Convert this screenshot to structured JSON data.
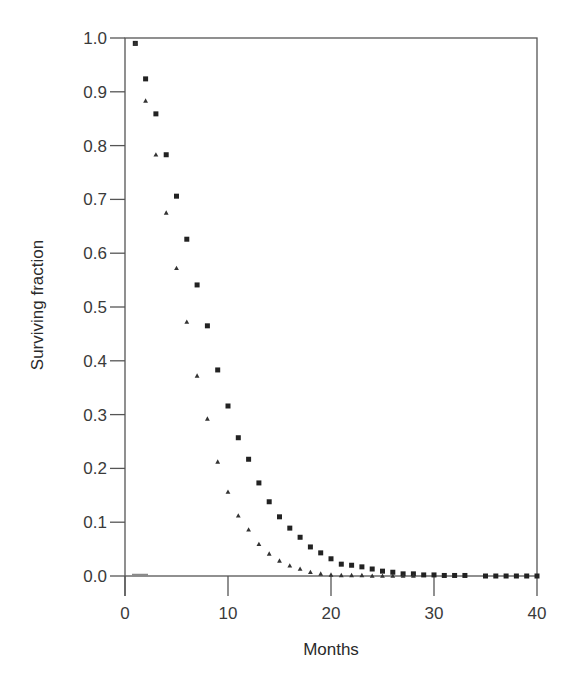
{
  "chart_data": {
    "type": "scatter",
    "title": "",
    "xlabel": "Months",
    "ylabel": "Surviving fraction",
    "xlim": [
      0,
      40
    ],
    "ylim": [
      0.0,
      1.0
    ],
    "x_ticks": [
      0,
      10,
      20,
      30,
      40
    ],
    "x_tick_labels": [
      "0",
      "10",
      "20",
      "30",
      "40"
    ],
    "y_ticks": [
      0.0,
      0.1,
      0.2,
      0.3,
      0.4,
      0.5,
      0.6,
      0.7,
      0.8,
      0.9,
      1.0
    ],
    "y_tick_labels": [
      "0.0",
      "0.1",
      "0.2",
      "0.3",
      "0.4",
      "0.5",
      "0.6",
      "0.7",
      "0.8",
      "0.9",
      "1.0"
    ],
    "grid": false,
    "legend": null,
    "series": [
      {
        "name": "squares",
        "marker": "square",
        "color": "#222222",
        "x": [
          1,
          2,
          3,
          4,
          5,
          6,
          7,
          8,
          9,
          10,
          11,
          12,
          13,
          14,
          15,
          16,
          17,
          18,
          19,
          20,
          21,
          22,
          23,
          24,
          25,
          26,
          27,
          28,
          29,
          30,
          31,
          32,
          33,
          35,
          36,
          37,
          38,
          39,
          40
        ],
        "values": [
          0.99,
          0.924,
          0.859,
          0.783,
          0.706,
          0.626,
          0.541,
          0.465,
          0.383,
          0.316,
          0.257,
          0.217,
          0.173,
          0.138,
          0.11,
          0.089,
          0.072,
          0.054,
          0.043,
          0.032,
          0.022,
          0.02,
          0.017,
          0.013,
          0.009,
          0.007,
          0.004,
          0.004,
          0.002,
          0.002,
          0.001,
          0.001,
          0.001,
          0.0,
          0.0,
          0.0,
          0.0,
          0.0,
          0.0
        ]
      },
      {
        "name": "triangles",
        "marker": "triangle",
        "color": "#333333",
        "x": [
          1,
          2,
          3,
          4,
          5,
          6,
          7,
          8,
          9,
          10,
          11,
          12,
          13,
          14,
          15,
          16,
          17,
          18,
          19,
          20,
          21,
          22,
          23,
          24,
          25,
          26,
          27,
          28
        ],
        "values": [
          0.99,
          0.883,
          0.783,
          0.675,
          0.572,
          0.472,
          0.372,
          0.292,
          0.212,
          0.156,
          0.112,
          0.086,
          0.059,
          0.041,
          0.028,
          0.019,
          0.013,
          0.007,
          0.004,
          0.002,
          0.001,
          0.001,
          0.001,
          0.0,
          0.0,
          0.0,
          0.0,
          0.0
        ]
      }
    ]
  },
  "layout": {
    "plot_left": 125,
    "plot_right": 537,
    "plot_top": 38,
    "plot_bottom": 576
  }
}
